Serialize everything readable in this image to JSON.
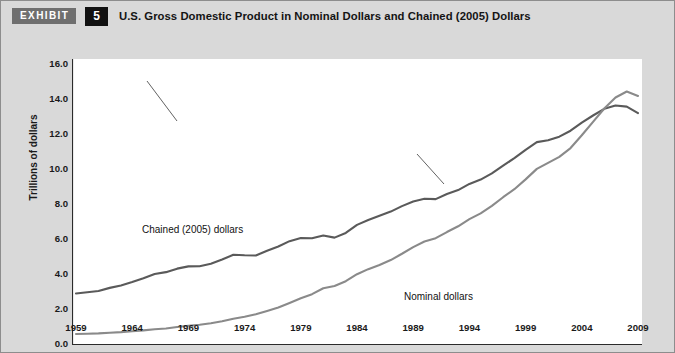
{
  "header": {
    "badge_label": "EXHIBIT",
    "number": "5",
    "title": "U.S. Gross Domestic Product in Nominal Dollars and Chained (2005) Dollars"
  },
  "colors": {
    "page_background": "#d9d9d9",
    "plot_background": "#ffffff",
    "border": "#8d8d8d",
    "badge_background": "#6f6f6f",
    "number_background": "#111111",
    "chained_series": "#5a5a5a",
    "nominal_series": "#8a8a8a",
    "axis": "#2b2b2b",
    "text": "#141414"
  },
  "chart_data": {
    "type": "line",
    "title": "U.S. Gross Domestic Product in Nominal Dollars and Chained (2005) Dollars",
    "xlabel": "",
    "ylabel": "Trillions of dollars",
    "xlim": [
      1959,
      2009
    ],
    "ylim": [
      0.0,
      16.0
    ],
    "ytick_step": 2.0,
    "xtick_step": 5,
    "minor_xtick_step": 1,
    "grid": false,
    "legend": "inline-annotations",
    "yticks": [
      "16.0",
      "14.0",
      "12.0",
      "10.0",
      "8.0",
      "6.0",
      "4.0",
      "2.0",
      "0.0"
    ],
    "xticks": [
      "1959",
      "1964",
      "1969",
      "1974",
      "1979",
      "1984",
      "1989",
      "1994",
      "1999",
      "2004",
      "2009"
    ],
    "x": [
      1959,
      1960,
      1961,
      1962,
      1963,
      1964,
      1965,
      1966,
      1967,
      1968,
      1969,
      1970,
      1971,
      1972,
      1973,
      1974,
      1975,
      1976,
      1977,
      1978,
      1979,
      1980,
      1981,
      1982,
      1983,
      1984,
      1985,
      1986,
      1987,
      1988,
      1989,
      1990,
      1991,
      1992,
      1993,
      1994,
      1995,
      1996,
      1997,
      1998,
      1999,
      2000,
      2001,
      2002,
      2003,
      2004,
      2005,
      2006,
      2007,
      2008,
      2009
    ],
    "series": [
      {
        "name": "Chained (2005) dollars",
        "color": "#5a5a5a",
        "annotation": "Chained (2005) dollars",
        "values": [
          2.83,
          2.9,
          2.97,
          3.15,
          3.29,
          3.48,
          3.7,
          3.94,
          4.05,
          4.25,
          4.38,
          4.39,
          4.53,
          4.77,
          5.04,
          5.01,
          5.0,
          5.27,
          5.51,
          5.82,
          6.0,
          5.99,
          6.14,
          6.02,
          6.29,
          6.75,
          7.03,
          7.27,
          7.51,
          7.82,
          8.09,
          8.24,
          8.22,
          8.51,
          8.74,
          9.09,
          9.34,
          9.69,
          10.13,
          10.57,
          11.04,
          11.48,
          11.59,
          11.79,
          12.13,
          12.59,
          13.0,
          13.38,
          13.57,
          13.51,
          13.14
        ]
      },
      {
        "name": "Nominal dollars",
        "color": "#8a8a8a",
        "annotation": "Nominal dollars",
        "values": [
          0.51,
          0.53,
          0.55,
          0.59,
          0.62,
          0.67,
          0.72,
          0.79,
          0.83,
          0.91,
          0.99,
          1.04,
          1.13,
          1.24,
          1.39,
          1.5,
          1.64,
          1.83,
          2.03,
          2.29,
          2.56,
          2.79,
          3.13,
          3.26,
          3.53,
          3.93,
          4.22,
          4.46,
          4.74,
          5.1,
          5.48,
          5.8,
          5.99,
          6.34,
          6.67,
          7.08,
          7.41,
          7.84,
          8.33,
          8.79,
          9.35,
          9.95,
          10.29,
          10.64,
          11.14,
          11.87,
          12.64,
          13.4,
          14.03,
          14.37,
          14.12
        ]
      }
    ]
  }
}
